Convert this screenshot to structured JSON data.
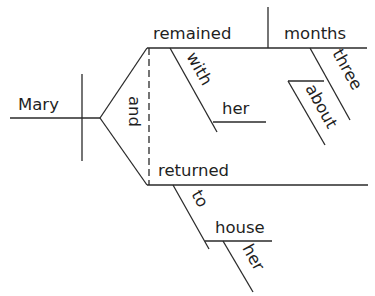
{
  "diagram": {
    "type": "sentence-diagram",
    "sentence_words": {
      "subject": "Mary",
      "conjunction": "and",
      "verb1": "remained",
      "verb1_complement": "months",
      "verb1_prep": "with",
      "verb1_prep_object": "her",
      "complement_modifier": "three",
      "complement_modifier_adverb": "about",
      "verb2": "returned",
      "verb2_prep": "to",
      "verb2_prep_object": "house",
      "verb2_prep_object_modifier": "her"
    },
    "colors": {
      "line": "#2a2a2a",
      "text": "#1f1f1f",
      "background": "#ffffff"
    }
  }
}
